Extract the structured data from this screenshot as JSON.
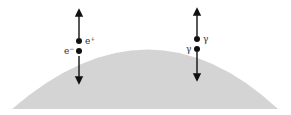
{
  "diagram": {
    "surface_color": "#d4d4d4",
    "ink_color": "#111111",
    "pairs": [
      {
        "name": "electron-positron-pair",
        "upper_label": "e",
        "upper_sup": "+",
        "lower_label": "e",
        "lower_sup": "−"
      },
      {
        "name": "photon-pair",
        "upper_label": "γ",
        "lower_label": "γ"
      }
    ]
  }
}
